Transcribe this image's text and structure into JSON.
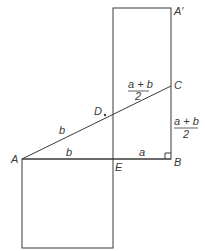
{
  "diagram": {
    "points": {
      "A": "A",
      "A_prime": "A′",
      "B": "B",
      "C": "C",
      "D": "D",
      "E": "E"
    },
    "segment_labels": {
      "AD": "b",
      "AE": "b",
      "EB": "a",
      "DC_num": "a + b",
      "DC_den": "2",
      "BC_num": "a + b",
      "BC_den": "2"
    },
    "colors": {
      "line": "#3a3a3a",
      "text": "#3a3a3a"
    }
  }
}
